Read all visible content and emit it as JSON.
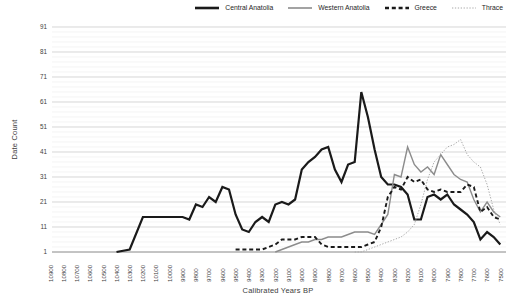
{
  "chart_data": {
    "type": "line",
    "title": "",
    "xlabel": "Calibrated Years BP",
    "ylabel": "Date Count",
    "legend_position": "top-right",
    "x_axis": {
      "direction": "descending",
      "start": 10900,
      "end": 7500,
      "step": 100,
      "tick_labels": [
        "10900",
        "10800",
        "10700",
        "10600",
        "10500",
        "10400",
        "10300",
        "10200",
        "10100",
        "10000",
        "9900",
        "9800",
        "9700",
        "9600",
        "9500",
        "9400",
        "9300",
        "9200",
        "9100",
        "9000",
        "8900",
        "8800",
        "8700",
        "8600",
        "8500",
        "8400",
        "8300",
        "8200",
        "8100",
        "8000",
        "7900",
        "7800",
        "7700",
        "7600",
        "7500"
      ]
    },
    "y_axis": {
      "min": 1,
      "max": 91,
      "ticks": [
        1,
        11,
        21,
        31,
        41,
        51,
        61,
        71,
        81,
        91
      ],
      "minor_grid_step": 2
    },
    "grid": {
      "major_color": "#c4c4c4",
      "minor_color": "#ededed",
      "axis_color": "#7a7a7a"
    },
    "text_color": "#3d3d3d",
    "series": [
      {
        "name": "Central Anatolia",
        "color": "#1a1a1a",
        "style": "solid",
        "width": 2.2,
        "points": [
          [
            10400,
            1
          ],
          [
            10300,
            2
          ],
          [
            10200,
            15
          ],
          [
            10100,
            15
          ],
          [
            10000,
            15
          ],
          [
            9900,
            15
          ],
          [
            9850,
            14
          ],
          [
            9800,
            20
          ],
          [
            9750,
            19
          ],
          [
            9700,
            23
          ],
          [
            9650,
            21
          ],
          [
            9600,
            27
          ],
          [
            9550,
            26
          ],
          [
            9500,
            16
          ],
          [
            9450,
            10
          ],
          [
            9400,
            9
          ],
          [
            9350,
            13
          ],
          [
            9300,
            15
          ],
          [
            9250,
            13
          ],
          [
            9200,
            20
          ],
          [
            9150,
            21
          ],
          [
            9100,
            20
          ],
          [
            9050,
            22
          ],
          [
            9000,
            34
          ],
          [
            8950,
            37
          ],
          [
            8900,
            39
          ],
          [
            8850,
            42
          ],
          [
            8800,
            43
          ],
          [
            8750,
            34
          ],
          [
            8700,
            29
          ],
          [
            8650,
            36
          ],
          [
            8600,
            37
          ],
          [
            8550,
            65
          ],
          [
            8500,
            55
          ],
          [
            8450,
            42
          ],
          [
            8400,
            31
          ],
          [
            8350,
            28
          ],
          [
            8300,
            28
          ],
          [
            8250,
            27
          ],
          [
            8200,
            24
          ],
          [
            8150,
            14
          ],
          [
            8100,
            14
          ],
          [
            8050,
            23
          ],
          [
            8000,
            24
          ],
          [
            7950,
            22
          ],
          [
            7900,
            24
          ],
          [
            7850,
            20
          ],
          [
            7800,
            18
          ],
          [
            7750,
            16
          ],
          [
            7700,
            13
          ],
          [
            7650,
            6
          ],
          [
            7600,
            9
          ],
          [
            7550,
            7
          ],
          [
            7500,
            4
          ]
        ]
      },
      {
        "name": "Western Anatolia",
        "color": "#8c8c8c",
        "style": "solid",
        "width": 1.4,
        "points": [
          [
            9200,
            1
          ],
          [
            9150,
            2
          ],
          [
            9100,
            3
          ],
          [
            9050,
            4
          ],
          [
            9000,
            5
          ],
          [
            8950,
            5
          ],
          [
            8900,
            6
          ],
          [
            8850,
            6
          ],
          [
            8800,
            7
          ],
          [
            8750,
            7
          ],
          [
            8700,
            7
          ],
          [
            8650,
            8
          ],
          [
            8600,
            9
          ],
          [
            8550,
            9
          ],
          [
            8500,
            9
          ],
          [
            8450,
            8
          ],
          [
            8400,
            12
          ],
          [
            8350,
            16
          ],
          [
            8300,
            32
          ],
          [
            8250,
            31
          ],
          [
            8200,
            43
          ],
          [
            8150,
            36
          ],
          [
            8100,
            33
          ],
          [
            8050,
            35
          ],
          [
            8000,
            32
          ],
          [
            7950,
            40
          ],
          [
            7900,
            36
          ],
          [
            7850,
            32
          ],
          [
            7800,
            30
          ],
          [
            7750,
            29
          ],
          [
            7700,
            22
          ],
          [
            7650,
            17
          ],
          [
            7600,
            21
          ],
          [
            7550,
            17
          ],
          [
            7500,
            15
          ]
        ]
      },
      {
        "name": "Greece",
        "color": "#1a1a1a",
        "style": "dashed",
        "width": 1.9,
        "points": [
          [
            9500,
            2
          ],
          [
            9400,
            2
          ],
          [
            9300,
            2
          ],
          [
            9250,
            3
          ],
          [
            9200,
            4
          ],
          [
            9150,
            6
          ],
          [
            9100,
            6
          ],
          [
            9050,
            6
          ],
          [
            9000,
            7
          ],
          [
            8950,
            7
          ],
          [
            8900,
            7
          ],
          [
            8850,
            4
          ],
          [
            8800,
            3
          ],
          [
            8750,
            3
          ],
          [
            8700,
            3
          ],
          [
            8650,
            3
          ],
          [
            8600,
            3
          ],
          [
            8550,
            3
          ],
          [
            8500,
            4
          ],
          [
            8450,
            5
          ],
          [
            8400,
            11
          ],
          [
            8350,
            23
          ],
          [
            8300,
            27
          ],
          [
            8250,
            26
          ],
          [
            8200,
            31
          ],
          [
            8150,
            29
          ],
          [
            8100,
            30
          ],
          [
            8050,
            26
          ],
          [
            8000,
            25
          ],
          [
            7950,
            26
          ],
          [
            7900,
            25
          ],
          [
            7850,
            25
          ],
          [
            7800,
            25
          ],
          [
            7750,
            28
          ],
          [
            7700,
            27
          ],
          [
            7650,
            17
          ],
          [
            7600,
            19
          ],
          [
            7550,
            15
          ],
          [
            7500,
            14
          ]
        ]
      },
      {
        "name": "Thrace",
        "color": "#a8a8a8",
        "style": "dotted",
        "width": 1,
        "points": [
          [
            8600,
            1
          ],
          [
            8550,
            1
          ],
          [
            8500,
            2
          ],
          [
            8450,
            3
          ],
          [
            8400,
            4
          ],
          [
            8350,
            5
          ],
          [
            8300,
            6
          ],
          [
            8250,
            7
          ],
          [
            8200,
            9
          ],
          [
            8150,
            12
          ],
          [
            8100,
            20
          ],
          [
            8050,
            30
          ],
          [
            8000,
            37
          ],
          [
            7950,
            40
          ],
          [
            7900,
            43
          ],
          [
            7850,
            44
          ],
          [
            7800,
            46
          ],
          [
            7750,
            40
          ],
          [
            7700,
            37
          ],
          [
            7650,
            35
          ],
          [
            7600,
            28
          ],
          [
            7550,
            18
          ],
          [
            7500,
            12
          ]
        ]
      }
    ]
  }
}
